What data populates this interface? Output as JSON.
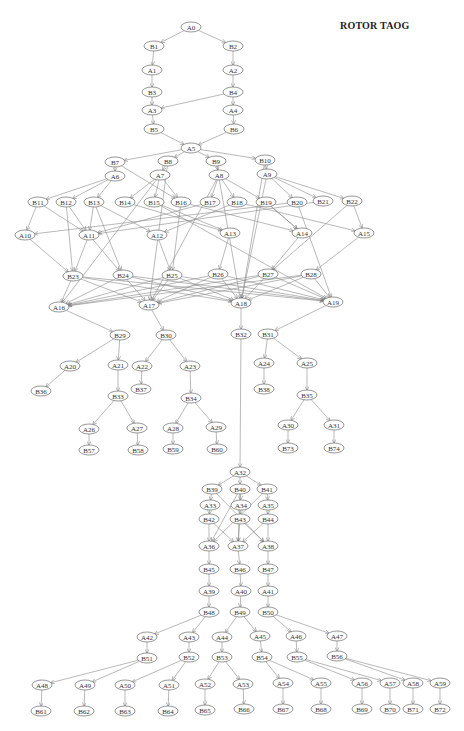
{
  "title": "ROTOR TAOG",
  "colors": {
    "edge": "#8a8a8a",
    "node_stroke": "#6a6a6a",
    "text": "#333333"
  },
  "nodes": [
    {
      "id": "A0",
      "x": 191,
      "y": 27
    },
    {
      "id": "B1",
      "x": 154,
      "y": 46
    },
    {
      "id": "B2",
      "x": 233,
      "y": 46
    },
    {
      "id": "A1",
      "x": 152,
      "y": 70
    },
    {
      "id": "A2",
      "x": 233,
      "y": 70
    },
    {
      "id": "B3",
      "x": 152,
      "y": 92
    },
    {
      "id": "B4",
      "x": 233,
      "y": 92
    },
    {
      "id": "A3",
      "x": 152,
      "y": 110
    },
    {
      "id": "A4",
      "x": 233,
      "y": 110
    },
    {
      "id": "B5",
      "x": 154,
      "y": 129
    },
    {
      "id": "B6",
      "x": 234,
      "y": 129
    },
    {
      "id": "A5",
      "x": 191,
      "y": 148
    },
    {
      "id": "B7",
      "x": 115,
      "y": 162
    },
    {
      "id": "B8",
      "x": 168,
      "y": 161
    },
    {
      "id": "B9",
      "x": 216,
      "y": 161
    },
    {
      "id": "B10",
      "x": 265,
      "y": 160
    },
    {
      "id": "A6",
      "x": 115,
      "y": 176
    },
    {
      "id": "A7",
      "x": 160,
      "y": 175
    },
    {
      "id": "A8",
      "x": 219,
      "y": 175
    },
    {
      "id": "A9",
      "x": 267,
      "y": 174
    },
    {
      "id": "B11",
      "x": 38,
      "y": 202
    },
    {
      "id": "B12",
      "x": 66,
      "y": 202
    },
    {
      "id": "B13",
      "x": 94,
      "y": 202
    },
    {
      "id": "B14",
      "x": 125,
      "y": 202
    },
    {
      "id": "B15",
      "x": 154,
      "y": 202
    },
    {
      "id": "B16",
      "x": 181,
      "y": 202
    },
    {
      "id": "B17",
      "x": 210,
      "y": 202
    },
    {
      "id": "B18",
      "x": 237,
      "y": 202
    },
    {
      "id": "B19",
      "x": 266,
      "y": 202
    },
    {
      "id": "B20",
      "x": 297,
      "y": 202
    },
    {
      "id": "B21",
      "x": 323,
      "y": 201
    },
    {
      "id": "B22",
      "x": 352,
      "y": 201
    },
    {
      "id": "A10",
      "x": 25,
      "y": 235
    },
    {
      "id": "A11",
      "x": 89,
      "y": 235
    },
    {
      "id": "A12",
      "x": 157,
      "y": 235
    },
    {
      "id": "A13",
      "x": 230,
      "y": 233
    },
    {
      "id": "A14",
      "x": 302,
      "y": 233
    },
    {
      "id": "A15",
      "x": 364,
      "y": 233
    },
    {
      "id": "B23",
      "x": 73,
      "y": 276
    },
    {
      "id": "B24",
      "x": 123,
      "y": 275
    },
    {
      "id": "B25",
      "x": 172,
      "y": 275
    },
    {
      "id": "B26",
      "x": 218,
      "y": 274
    },
    {
      "id": "B27",
      "x": 268,
      "y": 274
    },
    {
      "id": "B28",
      "x": 311,
      "y": 274
    },
    {
      "id": "A16",
      "x": 59,
      "y": 307
    },
    {
      "id": "A17",
      "x": 149,
      "y": 305
    },
    {
      "id": "A18",
      "x": 241,
      "y": 303
    },
    {
      "id": "A19",
      "x": 333,
      "y": 302
    },
    {
      "id": "B29",
      "x": 120,
      "y": 335
    },
    {
      "id": "B30",
      "x": 166,
      "y": 335
    },
    {
      "id": "B31",
      "x": 268,
      "y": 334
    },
    {
      "id": "B32",
      "x": 241,
      "y": 334
    },
    {
      "id": "A20",
      "x": 70,
      "y": 366
    },
    {
      "id": "A21",
      "x": 118,
      "y": 365
    },
    {
      "id": "A22",
      "x": 142,
      "y": 366
    },
    {
      "id": "A23",
      "x": 190,
      "y": 366
    },
    {
      "id": "A24",
      "x": 264,
      "y": 363
    },
    {
      "id": "A25",
      "x": 307,
      "y": 363
    },
    {
      "id": "B36",
      "x": 41,
      "y": 391
    },
    {
      "id": "B37",
      "x": 141,
      "y": 389
    },
    {
      "id": "B38",
      "x": 264,
      "y": 389
    },
    {
      "id": "B33",
      "x": 118,
      "y": 396
    },
    {
      "id": "B34",
      "x": 191,
      "y": 398
    },
    {
      "id": "B35",
      "x": 307,
      "y": 395
    },
    {
      "id": "A26",
      "x": 89,
      "y": 429
    },
    {
      "id": "A27",
      "x": 137,
      "y": 428
    },
    {
      "id": "A28",
      "x": 173,
      "y": 428
    },
    {
      "id": "A29",
      "x": 216,
      "y": 427
    },
    {
      "id": "A30",
      "x": 288,
      "y": 425
    },
    {
      "id": "A31",
      "x": 334,
      "y": 425
    },
    {
      "id": "B57",
      "x": 89,
      "y": 450
    },
    {
      "id": "B58",
      "x": 138,
      "y": 450
    },
    {
      "id": "B59",
      "x": 173,
      "y": 449
    },
    {
      "id": "B60",
      "x": 217,
      "y": 449
    },
    {
      "id": "B73",
      "x": 288,
      "y": 448
    },
    {
      "id": "B74",
      "x": 334,
      "y": 448
    },
    {
      "id": "A32",
      "x": 240,
      "y": 472
    },
    {
      "id": "B39",
      "x": 212,
      "y": 489
    },
    {
      "id": "B40",
      "x": 240,
      "y": 489
    },
    {
      "id": "B41",
      "x": 267,
      "y": 489
    },
    {
      "id": "A33",
      "x": 210,
      "y": 505
    },
    {
      "id": "A34",
      "x": 241,
      "y": 505
    },
    {
      "id": "A35",
      "x": 268,
      "y": 505
    },
    {
      "id": "B42",
      "x": 209,
      "y": 519
    },
    {
      "id": "B43",
      "x": 240,
      "y": 519
    },
    {
      "id": "B44",
      "x": 268,
      "y": 519
    },
    {
      "id": "A36",
      "x": 209,
      "y": 546
    },
    {
      "id": "A37",
      "x": 238,
      "y": 546
    },
    {
      "id": "A38",
      "x": 268,
      "y": 546
    },
    {
      "id": "B45",
      "x": 209,
      "y": 569
    },
    {
      "id": "B46",
      "x": 240,
      "y": 569
    },
    {
      "id": "B47",
      "x": 268,
      "y": 569
    },
    {
      "id": "A39",
      "x": 209,
      "y": 591
    },
    {
      "id": "A40",
      "x": 241,
      "y": 591
    },
    {
      "id": "A41",
      "x": 268,
      "y": 591
    },
    {
      "id": "B48",
      "x": 209,
      "y": 612
    },
    {
      "id": "B49",
      "x": 240,
      "y": 612
    },
    {
      "id": "B50",
      "x": 268,
      "y": 612
    },
    {
      "id": "A42",
      "x": 147,
      "y": 637
    },
    {
      "id": "A43",
      "x": 189,
      "y": 637
    },
    {
      "id": "A44",
      "x": 222,
      "y": 637
    },
    {
      "id": "A45",
      "x": 260,
      "y": 636
    },
    {
      "id": "A46",
      "x": 296,
      "y": 636
    },
    {
      "id": "A47",
      "x": 337,
      "y": 636
    },
    {
      "id": "B51",
      "x": 147,
      "y": 658
    },
    {
      "id": "B52",
      "x": 189,
      "y": 657
    },
    {
      "id": "B53",
      "x": 222,
      "y": 657
    },
    {
      "id": "B54",
      "x": 262,
      "y": 657
    },
    {
      "id": "B55",
      "x": 297,
      "y": 657
    },
    {
      "id": "B56",
      "x": 337,
      "y": 656
    },
    {
      "id": "A48",
      "x": 42,
      "y": 685
    },
    {
      "id": "A49",
      "x": 85,
      "y": 685
    },
    {
      "id": "A50",
      "x": 125,
      "y": 685
    },
    {
      "id": "A51",
      "x": 169,
      "y": 685
    },
    {
      "id": "A52",
      "x": 205,
      "y": 684
    },
    {
      "id": "A53",
      "x": 243,
      "y": 684
    },
    {
      "id": "A54",
      "x": 283,
      "y": 683
    },
    {
      "id": "A55",
      "x": 321,
      "y": 683
    },
    {
      "id": "A56",
      "x": 362,
      "y": 683
    },
    {
      "id": "A57",
      "x": 390,
      "y": 683
    },
    {
      "id": "A58",
      "x": 413,
      "y": 683
    },
    {
      "id": "A59",
      "x": 440,
      "y": 683
    },
    {
      "id": "B61",
      "x": 41,
      "y": 711
    },
    {
      "id": "B62",
      "x": 84,
      "y": 711
    },
    {
      "id": "B63",
      "x": 125,
      "y": 711
    },
    {
      "id": "B64",
      "x": 168,
      "y": 711
    },
    {
      "id": "B65",
      "x": 205,
      "y": 710
    },
    {
      "id": "B66",
      "x": 244,
      "y": 709
    },
    {
      "id": "B67",
      "x": 283,
      "y": 709
    },
    {
      "id": "B68",
      "x": 321,
      "y": 709
    },
    {
      "id": "B69",
      "x": 362,
      "y": 709
    },
    {
      "id": "B70",
      "x": 390,
      "y": 709
    },
    {
      "id": "B71",
      "x": 413,
      "y": 709
    },
    {
      "id": "B72",
      "x": 440,
      "y": 709
    }
  ],
  "edges": [
    [
      "A0",
      "B1"
    ],
    [
      "A0",
      "B2"
    ],
    [
      "B1",
      "A1"
    ],
    [
      "A1",
      "B3"
    ],
    [
      "B3",
      "A3"
    ],
    [
      "B2",
      "A2"
    ],
    [
      "A2",
      "B4"
    ],
    [
      "B4",
      "A4"
    ],
    [
      "B4",
      "A3"
    ],
    [
      "A3",
      "B5"
    ],
    [
      "A4",
      "B6"
    ],
    [
      "B5",
      "A5"
    ],
    [
      "B6",
      "A5"
    ],
    [
      "A5",
      "B7"
    ],
    [
      "A5",
      "B8"
    ],
    [
      "A5",
      "B9"
    ],
    [
      "A5",
      "B10"
    ],
    [
      "B7",
      "A6"
    ],
    [
      "B8",
      "A7"
    ],
    [
      "B9",
      "A8"
    ],
    [
      "B10",
      "A9"
    ],
    [
      "A6",
      "B11"
    ],
    [
      "A6",
      "B12"
    ],
    [
      "A6",
      "B13"
    ],
    [
      "A7",
      "B14"
    ],
    [
      "A7",
      "B15"
    ],
    [
      "A7",
      "B16"
    ],
    [
      "B7",
      "B16"
    ],
    [
      "A8",
      "B17"
    ],
    [
      "A8",
      "B18"
    ],
    [
      "A8",
      "B19"
    ],
    [
      "A9",
      "B20"
    ],
    [
      "A9",
      "B21"
    ],
    [
      "A9",
      "B22"
    ],
    [
      "B11",
      "A10"
    ],
    [
      "B11",
      "A11"
    ],
    [
      "B12",
      "A11"
    ],
    [
      "B13",
      "A11"
    ],
    [
      "B13",
      "A12"
    ],
    [
      "B14",
      "A13"
    ],
    [
      "B15",
      "A13"
    ],
    [
      "B16",
      "A14"
    ],
    [
      "B17",
      "A11"
    ],
    [
      "B18",
      "A15"
    ],
    [
      "B19",
      "A14"
    ],
    [
      "B20",
      "A10"
    ],
    [
      "B21",
      "A11"
    ],
    [
      "B22",
      "A15"
    ],
    [
      "B22",
      "B27"
    ],
    [
      "B16",
      "B25"
    ],
    [
      "B13",
      "B24"
    ],
    [
      "B12",
      "B23"
    ],
    [
      "B18",
      "A12"
    ],
    [
      "B19",
      "A14"
    ],
    [
      "A10",
      "B23"
    ],
    [
      "A11",
      "B23"
    ],
    [
      "A11",
      "B24"
    ],
    [
      "A12",
      "B25"
    ],
    [
      "A13",
      "B26"
    ],
    [
      "A14",
      "B27"
    ],
    [
      "A15",
      "B28"
    ],
    [
      "B23",
      "A16"
    ],
    [
      "B24",
      "A16"
    ],
    [
      "B25",
      "A16"
    ],
    [
      "B26",
      "A16"
    ],
    [
      "B27",
      "A16"
    ],
    [
      "B28",
      "A16"
    ],
    [
      "B23",
      "A17"
    ],
    [
      "B24",
      "A17"
    ],
    [
      "B25",
      "A17"
    ],
    [
      "B26",
      "A17"
    ],
    [
      "B27",
      "A17"
    ],
    [
      "B28",
      "A17"
    ],
    [
      "B23",
      "A18"
    ],
    [
      "B24",
      "A18"
    ],
    [
      "B25",
      "A18"
    ],
    [
      "B26",
      "A18"
    ],
    [
      "B27",
      "A18"
    ],
    [
      "B28",
      "A18"
    ],
    [
      "B23",
      "A19"
    ],
    [
      "B24",
      "A19"
    ],
    [
      "B25",
      "A19"
    ],
    [
      "B26",
      "A19"
    ],
    [
      "B27",
      "A19"
    ],
    [
      "B28",
      "A19"
    ],
    [
      "B8",
      "A17"
    ],
    [
      "B9",
      "A18"
    ],
    [
      "A9",
      "A18"
    ],
    [
      "B10",
      "A18"
    ],
    [
      "B20",
      "A19"
    ],
    [
      "B15",
      "A19"
    ],
    [
      "A7",
      "A16"
    ],
    [
      "A8",
      "A17"
    ],
    [
      "A16",
      "B29"
    ],
    [
      "A17",
      "B30"
    ],
    [
      "A18",
      "B32"
    ],
    [
      "A19",
      "B31"
    ],
    [
      "B29",
      "A20"
    ],
    [
      "B29",
      "A21"
    ],
    [
      "B30",
      "A22"
    ],
    [
      "B30",
      "A23"
    ],
    [
      "B31",
      "A24"
    ],
    [
      "B31",
      "A25"
    ],
    [
      "A20",
      "B36"
    ],
    [
      "A21",
      "B33"
    ],
    [
      "A22",
      "B37"
    ],
    [
      "A23",
      "B34"
    ],
    [
      "A24",
      "B38"
    ],
    [
      "A25",
      "B35"
    ],
    [
      "B33",
      "A26"
    ],
    [
      "B33",
      "A27"
    ],
    [
      "B34",
      "A28"
    ],
    [
      "B34",
      "A29"
    ],
    [
      "B35",
      "A30"
    ],
    [
      "B35",
      "A31"
    ],
    [
      "A26",
      "B57"
    ],
    [
      "A27",
      "B58"
    ],
    [
      "A28",
      "B59"
    ],
    [
      "A29",
      "B60"
    ],
    [
      "A30",
      "B73"
    ],
    [
      "A31",
      "B74"
    ],
    [
      "B32",
      "A32"
    ],
    [
      "A32",
      "B39"
    ],
    [
      "A32",
      "B40"
    ],
    [
      "A32",
      "B41"
    ],
    [
      "B39",
      "A33"
    ],
    [
      "B40",
      "A34"
    ],
    [
      "B41",
      "A35"
    ],
    [
      "A33",
      "B42"
    ],
    [
      "A34",
      "B43"
    ],
    [
      "A35",
      "B44"
    ],
    [
      "B39",
      "A38"
    ],
    [
      "B41",
      "A36"
    ],
    [
      "B40",
      "A36"
    ],
    [
      "B42",
      "A36"
    ],
    [
      "B42",
      "A37"
    ],
    [
      "B43",
      "A37"
    ],
    [
      "B43",
      "A38"
    ],
    [
      "B44",
      "A37"
    ],
    [
      "B44",
      "A38"
    ],
    [
      "B40",
      "A37"
    ],
    [
      "A36",
      "B45"
    ],
    [
      "A37",
      "B46"
    ],
    [
      "A38",
      "B47"
    ],
    [
      "B45",
      "A39"
    ],
    [
      "B46",
      "A40"
    ],
    [
      "B47",
      "A41"
    ],
    [
      "A39",
      "B48"
    ],
    [
      "A40",
      "B49"
    ],
    [
      "A41",
      "B50"
    ],
    [
      "B48",
      "A42"
    ],
    [
      "B48",
      "A43"
    ],
    [
      "B49",
      "A44"
    ],
    [
      "B49",
      "A45"
    ],
    [
      "B50",
      "A46"
    ],
    [
      "B50",
      "A47"
    ],
    [
      "A42",
      "B51"
    ],
    [
      "A43",
      "B52"
    ],
    [
      "A44",
      "B53"
    ],
    [
      "A45",
      "B54"
    ],
    [
      "A46",
      "B55"
    ],
    [
      "A47",
      "B56"
    ],
    [
      "B51",
      "A48"
    ],
    [
      "B51",
      "A49"
    ],
    [
      "B52",
      "A50"
    ],
    [
      "B52",
      "A51"
    ],
    [
      "B53",
      "A52"
    ],
    [
      "B53",
      "A53"
    ],
    [
      "B54",
      "A54"
    ],
    [
      "B54",
      "A55"
    ],
    [
      "B55",
      "A56"
    ],
    [
      "B55",
      "A57"
    ],
    [
      "B56",
      "A58"
    ],
    [
      "B56",
      "A59"
    ],
    [
      "A48",
      "B61"
    ],
    [
      "A49",
      "B62"
    ],
    [
      "A50",
      "B63"
    ],
    [
      "A51",
      "B64"
    ],
    [
      "A52",
      "B65"
    ],
    [
      "A53",
      "B66"
    ],
    [
      "A54",
      "B67"
    ],
    [
      "A55",
      "B68"
    ],
    [
      "A56",
      "B69"
    ],
    [
      "A57",
      "B70"
    ],
    [
      "A58",
      "B71"
    ],
    [
      "A59",
      "B72"
    ]
  ]
}
